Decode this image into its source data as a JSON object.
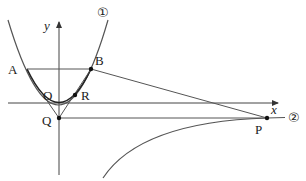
{
  "diagram": {
    "curves": {
      "curve1_label": "①",
      "curve2_label": "②"
    },
    "axes": {
      "x_label": "x",
      "y_label": "y",
      "origin_label": "O"
    },
    "points": {
      "A": "A",
      "B": "B",
      "P": "P",
      "Q": "Q",
      "R": "R"
    }
  }
}
